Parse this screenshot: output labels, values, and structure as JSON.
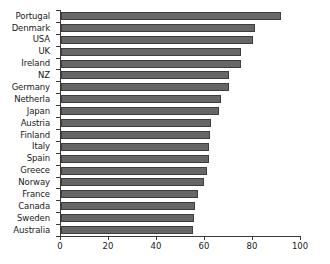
{
  "chart_data": {
    "type": "bar",
    "orientation": "horizontal",
    "title": "",
    "xlabel": "",
    "ylabel": "",
    "xlim": [
      0,
      100
    ],
    "xticks": [
      0,
      20,
      40,
      60,
      80,
      100
    ],
    "grid": false,
    "legend": null,
    "bar_color": "#666666",
    "bar_edge_color": "#3d3d3d",
    "categories": [
      "Portugal",
      "Denmark",
      "USA",
      "UK",
      "Ireland",
      "NZ",
      "Germany",
      "Netherla",
      "Japan",
      "Austria",
      "Finland",
      "Italy",
      "Spain",
      "Greece",
      "Norway",
      "France",
      "Canada",
      "Sweden",
      "Australia"
    ],
    "values": [
      91.5,
      81,
      80,
      75,
      75,
      70,
      70,
      66.5,
      66,
      62.5,
      62,
      61.5,
      61.5,
      61,
      59.5,
      57,
      56,
      55.5,
      55
    ]
  }
}
